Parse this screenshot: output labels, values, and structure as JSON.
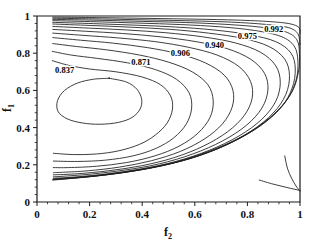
{
  "figure": {
    "background": "#ffffff",
    "line_color": "#1c1c1c"
  },
  "axes": {
    "x": {
      "title": "f",
      "subscript": "2",
      "min": 0,
      "max": 1,
      "ticks": [
        "0",
        "0.2",
        "0.4",
        "0.6",
        "0.8",
        "1"
      ],
      "tick_values": [
        0,
        0.2,
        0.4,
        0.6,
        0.8,
        1
      ],
      "minor_per_interval": 4
    },
    "y": {
      "title": "f",
      "subscript": "1",
      "min": 0,
      "max": 1,
      "ticks": [
        "0",
        "0.2",
        "0.4",
        "0.6",
        "0.8",
        "1"
      ],
      "tick_values": [
        0,
        0.2,
        0.4,
        0.6,
        0.8,
        1
      ],
      "minor_per_interval": 4
    }
  },
  "chart_data": {
    "type": "contour",
    "title": "",
    "xlabel": "f2",
    "ylabel": "f1",
    "xlim": [
      0,
      1
    ],
    "ylim": [
      0,
      1
    ],
    "grid": false,
    "legend": "none",
    "labeled_levels": [
      0.837,
      0.871,
      0.906,
      0.94,
      0.975,
      0.992
    ],
    "labels": [
      {
        "text": "0.837",
        "x": 0.105,
        "y": 0.695
      },
      {
        "text": "0.871",
        "x": 0.395,
        "y": 0.735
      },
      {
        "text": "0.906",
        "x": 0.545,
        "y": 0.785
      },
      {
        "text": "0.940",
        "x": 0.675,
        "y": 0.83
      },
      {
        "text": "0.975",
        "x": 0.8,
        "y": 0.875
      },
      {
        "text": "0.992",
        "x": 0.9,
        "y": 0.915
      }
    ],
    "maximum_region": {
      "x": 0.25,
      "y": 0.55,
      "note": "innermost closed contour encircles optimum"
    },
    "level_count": 14,
    "contours": [
      {
        "level": 0.837,
        "closed": true,
        "points": [
          [
            0.275,
            0.665
          ],
          [
            0.215,
            0.66
          ],
          [
            0.155,
            0.64
          ],
          [
            0.105,
            0.6
          ],
          [
            0.078,
            0.545
          ],
          [
            0.08,
            0.487
          ],
          [
            0.115,
            0.447
          ],
          [
            0.172,
            0.425
          ],
          [
            0.24,
            0.418
          ],
          [
            0.31,
            0.428
          ],
          [
            0.362,
            0.455
          ],
          [
            0.392,
            0.5
          ],
          [
            0.398,
            0.552
          ],
          [
            0.38,
            0.606
          ],
          [
            0.34,
            0.645
          ],
          [
            0.275,
            0.665
          ]
        ]
      },
      {
        "level": 0.845,
        "closed": false,
        "points": [
          [
            0.058,
            0.76
          ],
          [
            0.12,
            0.735
          ],
          [
            0.2,
            0.715
          ],
          [
            0.3,
            0.7
          ],
          [
            0.4,
            0.672
          ],
          [
            0.47,
            0.63
          ],
          [
            0.508,
            0.57
          ],
          [
            0.515,
            0.5
          ],
          [
            0.495,
            0.425
          ],
          [
            0.45,
            0.36
          ],
          [
            0.39,
            0.31
          ],
          [
            0.31,
            0.275
          ],
          [
            0.225,
            0.258
          ],
          [
            0.14,
            0.255
          ],
          [
            0.062,
            0.262
          ]
        ]
      },
      {
        "level": 0.855,
        "closed": false,
        "points": [
          [
            0.058,
            0.81
          ],
          [
            0.13,
            0.79
          ],
          [
            0.23,
            0.772
          ],
          [
            0.345,
            0.748
          ],
          [
            0.45,
            0.712
          ],
          [
            0.53,
            0.66
          ],
          [
            0.578,
            0.588
          ],
          [
            0.588,
            0.505
          ],
          [
            0.568,
            0.42
          ],
          [
            0.52,
            0.345
          ],
          [
            0.452,
            0.288
          ],
          [
            0.365,
            0.248
          ],
          [
            0.26,
            0.225
          ],
          [
            0.155,
            0.218
          ],
          [
            0.062,
            0.22
          ]
        ]
      },
      {
        "level": 0.871,
        "closed": false,
        "points": [
          [
            0.06,
            0.852
          ],
          [
            0.15,
            0.836
          ],
          [
            0.265,
            0.818
          ],
          [
            0.39,
            0.79
          ],
          [
            0.5,
            0.752
          ],
          [
            0.59,
            0.7
          ],
          [
            0.65,
            0.63
          ],
          [
            0.67,
            0.545
          ],
          [
            0.658,
            0.455
          ],
          [
            0.612,
            0.37
          ],
          [
            0.54,
            0.3
          ],
          [
            0.448,
            0.248
          ],
          [
            0.34,
            0.212
          ],
          [
            0.225,
            0.192
          ],
          [
            0.12,
            0.185
          ],
          [
            0.062,
            0.185
          ]
        ]
      },
      {
        "level": 0.885,
        "closed": false,
        "points": [
          [
            0.06,
            0.884
          ],
          [
            0.165,
            0.87
          ],
          [
            0.29,
            0.854
          ],
          [
            0.42,
            0.83
          ],
          [
            0.54,
            0.796
          ],
          [
            0.64,
            0.748
          ],
          [
            0.712,
            0.682
          ],
          [
            0.745,
            0.6
          ],
          [
            0.742,
            0.51
          ],
          [
            0.705,
            0.42
          ],
          [
            0.638,
            0.34
          ],
          [
            0.545,
            0.272
          ],
          [
            0.435,
            0.222
          ],
          [
            0.315,
            0.188
          ],
          [
            0.195,
            0.168
          ],
          [
            0.1,
            0.16
          ],
          [
            0.062,
            0.158
          ]
        ]
      },
      {
        "level": 0.906,
        "closed": false,
        "points": [
          [
            0.06,
            0.908
          ],
          [
            0.175,
            0.896
          ],
          [
            0.31,
            0.882
          ],
          [
            0.45,
            0.862
          ],
          [
            0.575,
            0.832
          ],
          [
            0.685,
            0.79
          ],
          [
            0.768,
            0.728
          ],
          [
            0.812,
            0.648
          ],
          [
            0.818,
            0.558
          ],
          [
            0.788,
            0.465
          ],
          [
            0.725,
            0.378
          ],
          [
            0.632,
            0.3
          ],
          [
            0.52,
            0.238
          ],
          [
            0.398,
            0.195
          ],
          [
            0.272,
            0.168
          ],
          [
            0.155,
            0.152
          ],
          [
            0.062,
            0.146
          ]
        ]
      },
      {
        "level": 0.92,
        "closed": false,
        "points": [
          [
            0.06,
            0.928
          ],
          [
            0.185,
            0.918
          ],
          [
            0.325,
            0.906
          ],
          [
            0.47,
            0.888
          ],
          [
            0.605,
            0.862
          ],
          [
            0.722,
            0.825
          ],
          [
            0.812,
            0.768
          ],
          [
            0.865,
            0.692
          ],
          [
            0.878,
            0.602
          ],
          [
            0.855,
            0.505
          ],
          [
            0.796,
            0.412
          ],
          [
            0.705,
            0.328
          ],
          [
            0.592,
            0.258
          ],
          [
            0.465,
            0.205
          ],
          [
            0.335,
            0.172
          ],
          [
            0.205,
            0.15
          ],
          [
            0.095,
            0.138
          ],
          [
            0.062,
            0.136
          ]
        ]
      },
      {
        "level": 0.94,
        "closed": false,
        "points": [
          [
            0.06,
            0.944
          ],
          [
            0.195,
            0.935
          ],
          [
            0.34,
            0.925
          ],
          [
            0.49,
            0.91
          ],
          [
            0.63,
            0.888
          ],
          [
            0.755,
            0.855
          ],
          [
            0.85,
            0.805
          ],
          [
            0.908,
            0.732
          ],
          [
            0.925,
            0.642
          ],
          [
            0.908,
            0.542
          ],
          [
            0.855,
            0.445
          ],
          [
            0.768,
            0.355
          ],
          [
            0.655,
            0.278
          ],
          [
            0.528,
            0.218
          ],
          [
            0.395,
            0.178
          ],
          [
            0.258,
            0.15
          ],
          [
            0.13,
            0.133
          ],
          [
            0.062,
            0.128
          ]
        ]
      },
      {
        "level": 0.952,
        "closed": false,
        "points": [
          [
            0.06,
            0.957
          ],
          [
            0.205,
            0.949
          ],
          [
            0.355,
            0.94
          ],
          [
            0.508,
            0.928
          ],
          [
            0.652,
            0.908
          ],
          [
            0.782,
            0.88
          ],
          [
            0.882,
            0.836
          ],
          [
            0.942,
            0.768
          ],
          [
            0.96,
            0.68
          ],
          [
            0.946,
            0.578
          ],
          [
            0.898,
            0.478
          ],
          [
            0.815,
            0.382
          ],
          [
            0.705,
            0.298
          ],
          [
            0.578,
            0.232
          ],
          [
            0.442,
            0.186
          ],
          [
            0.302,
            0.155
          ],
          [
            0.165,
            0.134
          ],
          [
            0.062,
            0.124
          ]
        ]
      },
      {
        "level": 0.962,
        "closed": false,
        "points": [
          [
            0.06,
            0.966
          ],
          [
            0.215,
            0.959
          ],
          [
            0.37,
            0.951
          ],
          [
            0.525,
            0.941
          ],
          [
            0.672,
            0.925
          ],
          [
            0.805,
            0.9
          ],
          [
            0.908,
            0.862
          ],
          [
            0.966,
            0.8
          ],
          [
            0.982,
            0.715
          ],
          [
            0.97,
            0.612
          ],
          [
            0.928,
            0.508
          ],
          [
            0.848,
            0.408
          ],
          [
            0.74,
            0.32
          ],
          [
            0.615,
            0.248
          ],
          [
            0.478,
            0.196
          ],
          [
            0.338,
            0.16
          ],
          [
            0.195,
            0.136
          ],
          [
            0.062,
            0.122
          ]
        ]
      },
      {
        "level": 0.975,
        "closed": false,
        "points": [
          [
            0.06,
            0.975
          ],
          [
            0.225,
            0.969
          ],
          [
            0.385,
            0.962
          ],
          [
            0.545,
            0.954
          ],
          [
            0.695,
            0.942
          ],
          [
            0.828,
            0.922
          ],
          [
            0.928,
            0.89
          ],
          [
            0.978,
            0.838
          ],
          [
            0.992,
            0.758
          ],
          [
            0.985,
            0.655
          ],
          [
            0.95,
            0.548
          ],
          [
            0.878,
            0.442
          ],
          [
            0.775,
            0.346
          ],
          [
            0.652,
            0.268
          ],
          [
            0.515,
            0.208
          ],
          [
            0.375,
            0.168
          ],
          [
            0.228,
            0.14
          ],
          [
            0.085,
            0.122
          ],
          [
            0.06,
            0.12
          ]
        ]
      },
      {
        "level": 0.983,
        "closed": false,
        "points": [
          [
            0.06,
            0.982
          ],
          [
            0.235,
            0.977
          ],
          [
            0.4,
            0.971
          ],
          [
            0.565,
            0.965
          ],
          [
            0.718,
            0.955
          ],
          [
            0.85,
            0.94
          ],
          [
            0.945,
            0.915
          ],
          [
            0.988,
            0.872
          ],
          [
            0.998,
            0.798
          ],
          [
            0.994,
            0.698
          ],
          [
            0.968,
            0.588
          ],
          [
            0.905,
            0.478
          ],
          [
            0.808,
            0.375
          ],
          [
            0.688,
            0.292
          ],
          [
            0.552,
            0.225
          ],
          [
            0.41,
            0.178
          ],
          [
            0.262,
            0.146
          ],
          [
            0.11,
            0.124
          ],
          [
            0.06,
            0.118
          ]
        ]
      },
      {
        "level": 0.988,
        "closed": false,
        "points": [
          [
            0.06,
            0.988
          ],
          [
            0.245,
            0.984
          ],
          [
            0.415,
            0.979
          ],
          [
            0.585,
            0.974
          ],
          [
            0.74,
            0.967
          ],
          [
            0.868,
            0.955
          ],
          [
            0.955,
            0.938
          ],
          [
            0.992,
            0.905
          ],
          [
            1.0,
            0.845
          ]
        ]
      },
      {
        "level": 0.992,
        "closed": false,
        "points": [
          [
            0.06,
            0.994
          ],
          [
            0.25,
            0.991
          ],
          [
            0.43,
            0.987
          ],
          [
            0.605,
            0.983
          ],
          [
            0.76,
            0.978
          ],
          [
            0.885,
            0.97
          ],
          [
            0.962,
            0.958
          ],
          [
            0.996,
            0.938
          ],
          [
            1.0,
            0.905
          ]
        ]
      },
      {
        "level": 0.995,
        "closed": false,
        "points": [
          [
            0.942,
            0.248
          ],
          [
            0.952,
            0.182
          ],
          [
            0.968,
            0.128
          ],
          [
            0.985,
            0.086
          ],
          [
            1.0,
            0.058
          ]
        ]
      },
      {
        "level": 0.994,
        "closed": false,
        "points": [
          [
            0.845,
            0.118
          ],
          [
            0.898,
            0.096
          ],
          [
            0.95,
            0.078
          ],
          [
            1.0,
            0.062
          ]
        ]
      }
    ]
  }
}
